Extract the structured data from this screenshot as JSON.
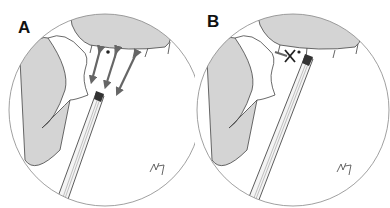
{
  "figure": {
    "panels": [
      {
        "label": "A",
        "description": "Endoscopic view with arrows showing multiple directions of movement near a structure"
      },
      {
        "label": "B",
        "description": "Endoscopic view with X mark indicating blocked position near instrument tip"
      }
    ],
    "signature": "artist-signature",
    "colors": {
      "shaded_tissue": "#d4d4d4",
      "outline": "#333333",
      "arrow": "#666666",
      "background": "#ffffff"
    }
  }
}
